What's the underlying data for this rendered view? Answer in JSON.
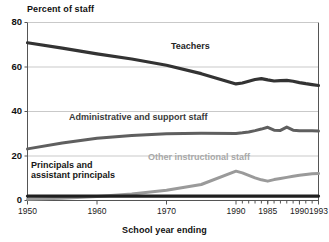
{
  "chart_data": {
    "type": "line",
    "title": "Percent of staff",
    "xlabel": "School year ending",
    "ylabel": "Percent of staff",
    "xlim": [
      1950,
      1993
    ],
    "ylim": [
      0,
      80
    ],
    "grid": true,
    "gridlines_y": [
      20,
      40,
      60,
      80
    ],
    "legend_position": "inline-annotations",
    "ytick_labels": [
      "0",
      "20",
      "40",
      "60",
      "80"
    ],
    "ytick_values": [
      0,
      20,
      40,
      60,
      80
    ],
    "xtick_labels": [
      "1950",
      "1960",
      "1970",
      "1990",
      "1985",
      "1990",
      "1993"
    ],
    "xtick_values": [
      1950,
      1960,
      1970,
      1980,
      1985,
      1990,
      1993
    ],
    "minor_xticks": [
      1981,
      1982,
      1983,
      1984,
      1985,
      1986,
      1987,
      1988,
      1989,
      1990,
      1991,
      1992,
      1993
    ],
    "series": [
      {
        "name": "Teachers",
        "color": "#333333",
        "label_color": "#252525",
        "x": [
          1950,
          1955,
          1960,
          1965,
          1970,
          1975,
          1980,
          1981,
          1982,
          1983,
          1984,
          1985,
          1986,
          1987,
          1988,
          1989,
          1990,
          1991,
          1992,
          1993
        ],
        "values": [
          70.9,
          68.5,
          65.9,
          63.6,
          60.8,
          57.0,
          52.4,
          52.8,
          53.6,
          54.4,
          54.8,
          54.2,
          53.7,
          53.9,
          54.0,
          53.6,
          53.0,
          52.5,
          52.1,
          51.7
        ]
      },
      {
        "name": "Administrative and support staff",
        "color": "#5f5f5f",
        "label_color": "#3a3a3a",
        "x": [
          1950,
          1955,
          1960,
          1965,
          1970,
          1975,
          1980,
          1981,
          1982,
          1983,
          1984,
          1985,
          1986,
          1987,
          1988,
          1989,
          1990,
          1991,
          1992,
          1993
        ],
        "values": [
          23.2,
          25.8,
          28.0,
          29.2,
          30.0,
          30.2,
          30.1,
          30.4,
          30.8,
          31.4,
          32.1,
          32.9,
          31.6,
          31.5,
          33.0,
          31.6,
          31.3,
          31.4,
          31.3,
          31.2
        ]
      },
      {
        "name": "Other instructional staff",
        "color": "#9a9a9a",
        "label_color": "#a8a8a8",
        "x": [
          1950,
          1955,
          1960,
          1965,
          1970,
          1975,
          1980,
          1981,
          1982,
          1983,
          1984,
          1985,
          1986,
          1987,
          1988,
          1989,
          1990,
          1991,
          1992,
          1993
        ],
        "values": [
          0.6,
          1.0,
          1.8,
          2.9,
          4.6,
          7.2,
          13.2,
          12.4,
          11.3,
          10.2,
          9.3,
          8.7,
          9.4,
          9.9,
          10.4,
          10.9,
          11.3,
          11.7,
          12.0,
          12.1
        ]
      },
      {
        "name": "Principals and assistant principals",
        "color": "#1f1f1f",
        "label_color": "#161616",
        "x": [
          1950,
          1955,
          1960,
          1965,
          1970,
          1975,
          1980,
          1981,
          1982,
          1983,
          1984,
          1985,
          1986,
          1987,
          1988,
          1989,
          1990,
          1991,
          1992,
          1993
        ],
        "values": [
          2.0,
          2.0,
          2.0,
          2.0,
          2.0,
          2.0,
          2.0,
          2.0,
          2.0,
          2.0,
          2.0,
          2.0,
          2.0,
          2.0,
          2.0,
          2.0,
          2.0,
          2.0,
          2.0,
          2.0
        ]
      }
    ],
    "annotations": [
      {
        "id": "teachers",
        "text": "Teachers"
      },
      {
        "id": "admin",
        "text": "Administrative and support staff"
      },
      {
        "id": "other",
        "text": "Other instructional staff"
      },
      {
        "id": "principals_line1",
        "text": "Principals and"
      },
      {
        "id": "principals_line2",
        "text": "assistant principals"
      }
    ]
  },
  "colors": {
    "teachers": "#333333",
    "admin": "#5f5f5f",
    "other": "#9a9a9a",
    "principals": "#1f1f1f",
    "grid": "#c9c9c9",
    "axis": "#555555",
    "background": "#ffffff"
  }
}
